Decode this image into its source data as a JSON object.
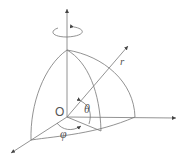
{
  "diagram": {
    "labels": {
      "origin": "O",
      "radius": "r",
      "polar_angle": "θ",
      "azimuth_angle": "φ"
    },
    "elements": [
      "z-axis",
      "x-axis",
      "y-axis",
      "radius-vector",
      "rotation-arrow",
      "octant-sphere"
    ],
    "colors": {
      "stroke": "#666666",
      "text": "#555555"
    }
  }
}
